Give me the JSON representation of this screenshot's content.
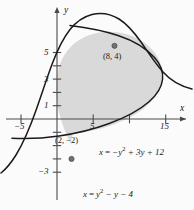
{
  "figure": {
    "background_color": "#fbfbfb",
    "shade_color": "#d9d9d9",
    "curve_color": "#1a1a1a",
    "axis_color": "#4a4a4a"
  },
  "axes": {
    "x_axis_label": "x",
    "y_axis_label": "y",
    "x_ticks": [
      {
        "value": -5,
        "label": "−5"
      },
      {
        "value": 5,
        "label": "5"
      },
      {
        "value": 10,
        "label": ""
      },
      {
        "value": 15,
        "label": "15"
      }
    ],
    "y_ticks": [
      {
        "value": 5,
        "label": "5"
      },
      {
        "value": 4,
        "label": ""
      },
      {
        "value": 3,
        "label": "3"
      },
      {
        "value": 2,
        "label": ""
      },
      {
        "value": 1,
        "label": "1"
      },
      {
        "value": -3,
        "label": "−3"
      }
    ],
    "origin_px": {
      "x": 57,
      "y": 119
    },
    "unit_px": {
      "x": 7.25,
      "y": 13.3
    }
  },
  "curves": [
    {
      "name": "left-opening-parabola",
      "equation_display": "x = −y² + 3y + 12",
      "equation_parts": {
        "lhs": "x",
        "eq": "=",
        "rhs_a": "−y",
        "rhs_exp": "2",
        "rhs_b": "+ 3y + 12"
      },
      "label_position_px": {
        "x": 100,
        "y": 152
      }
    },
    {
      "name": "right-opening-parabola",
      "equation_display": "x = y² − y − 4",
      "equation_parts": {
        "lhs": "x",
        "eq": "=",
        "rhs_a": "y",
        "rhs_exp": "2",
        "rhs_b": "− y − 4"
      },
      "label_position_px": {
        "x": 84,
        "y": 194
      }
    }
  ],
  "points": [
    {
      "name": "upper-intersection",
      "label": "(8, 4)",
      "x": 8,
      "y": 4,
      "label_position_px": {
        "x": 103,
        "y": 56
      }
    },
    {
      "name": "lower-intersection",
      "label": "(2, −2)",
      "x": 2,
      "y": -2,
      "label_position_px": {
        "x": 57,
        "y": 140
      }
    }
  ]
}
